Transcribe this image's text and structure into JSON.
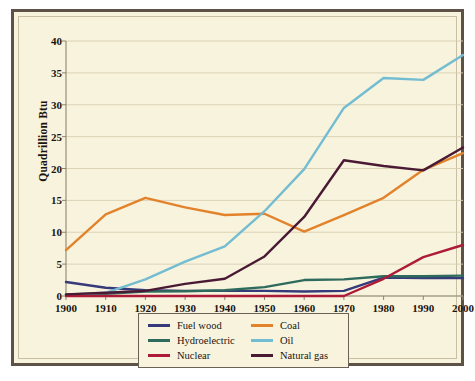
{
  "figure": {
    "background_color": "#f8f3dd",
    "frame_color": "#5d5248",
    "inner_frame_color": "#c9bfa4"
  },
  "chart_data": {
    "type": "line",
    "title": "",
    "xlabel": "",
    "ylabel": "Quadrillion Btu",
    "x": [
      1900,
      1910,
      1920,
      1930,
      1940,
      1950,
      1960,
      1970,
      1980,
      1990,
      2000
    ],
    "categories": [
      "1900",
      "1910",
      "1920",
      "1930",
      "1940",
      "1950",
      "1960",
      "1970",
      "1980",
      "1990",
      "2000"
    ],
    "xlim": [
      1900,
      2000
    ],
    "ylim": [
      0,
      40
    ],
    "yticks": [
      0,
      5,
      10,
      15,
      20,
      25,
      30,
      35,
      40
    ],
    "ytick_labels": [
      "0",
      "5",
      "10",
      "15",
      "20",
      "25",
      "30",
      "35",
      "40"
    ],
    "grid": "horizontal",
    "grid_color": "#d8cfb2",
    "legend_position": "below-center",
    "series": [
      {
        "name": "Fuel wood",
        "color": "#373a7a",
        "values": [
          2.2,
          1.3,
          0.9,
          0.8,
          0.8,
          0.8,
          0.7,
          0.8,
          2.9,
          2.8,
          2.8
        ]
      },
      {
        "name": "Coal",
        "color": "#e2822b",
        "values": [
          7.2,
          12.8,
          15.4,
          13.9,
          12.7,
          12.9,
          10.1,
          12.7,
          15.4,
          19.8,
          22.4
        ]
      },
      {
        "name": "Hydroelectric",
        "color": "#2e6b5c",
        "values": [
          0.25,
          0.35,
          0.7,
          0.75,
          0.9,
          1.4,
          2.5,
          2.6,
          3.1,
          3.1,
          3.2
        ]
      },
      {
        "name": "Oil",
        "color": "#73bcd1",
        "values": [
          0.2,
          0.5,
          2.6,
          5.4,
          7.8,
          13.3,
          19.9,
          29.5,
          34.2,
          33.9,
          37.8
        ]
      },
      {
        "name": "Nuclear",
        "color": "#ad1b39",
        "values": [
          0,
          0,
          0,
          0,
          0,
          0,
          0,
          0.0,
          2.7,
          6.1,
          8.0
        ]
      },
      {
        "name": "Natural gas",
        "color": "#4a1a35",
        "values": [
          0.25,
          0.5,
          0.8,
          1.9,
          2.7,
          6.2,
          12.4,
          21.3,
          20.4,
          19.7,
          23.3
        ]
      }
    ]
  },
  "legend": {
    "items": [
      {
        "label": "Fuel wood",
        "color": "#373a7a"
      },
      {
        "label": "Coal",
        "color": "#e2822b"
      },
      {
        "label": "Hydroelectric",
        "color": "#2e6b5c"
      },
      {
        "label": "Oil",
        "color": "#73bcd1"
      },
      {
        "label": "Nuclear",
        "color": "#ad1b39"
      },
      {
        "label": "Natural gas",
        "color": "#4a1a35"
      }
    ]
  }
}
